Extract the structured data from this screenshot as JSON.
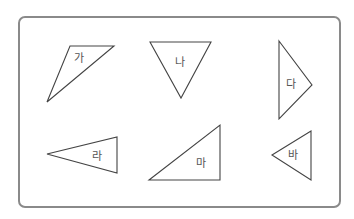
{
  "figure": {
    "frame_color": "#8a8a8a",
    "stroke_color": "#444444",
    "label_color": "#555555"
  },
  "shapes": [
    {
      "id": "ga",
      "label": "가",
      "points": "70,46 114,46 47,102",
      "label_x": 74,
      "label_y": 62
    },
    {
      "id": "na",
      "label": "나",
      "points": "150,42 211,42 181,98",
      "label_x": 175,
      "label_y": 66
    },
    {
      "id": "da",
      "label": "다",
      "points": "279,41 312,85 279,119",
      "label_x": 286,
      "label_y": 88
    },
    {
      "id": "ra",
      "label": "라",
      "points": "47,154 117,137 117,173",
      "label_x": 92,
      "label_y": 160
    },
    {
      "id": "ma",
      "label": "마",
      "points": "149,180 220,125 220,180",
      "label_x": 196,
      "label_y": 167
    },
    {
      "id": "ba",
      "label": "바",
      "points": "272,155 311,131 311,180",
      "label_x": 288,
      "label_y": 159
    }
  ]
}
